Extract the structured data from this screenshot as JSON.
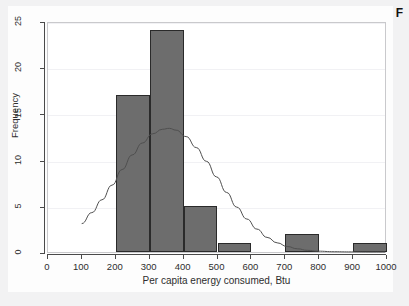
{
  "figure": {
    "corner_label": "F",
    "background_color": "#f2f2f3",
    "canvas_color": "#ffffff"
  },
  "chart_data": {
    "type": "bar",
    "title": "",
    "subtitle": "",
    "xlabel": "Per capita energy consumed, Btu",
    "ylabel": "Frequency",
    "xlim": [
      0,
      1000
    ],
    "ylim": [
      0,
      25
    ],
    "xticks": [
      0,
      100,
      200,
      300,
      400,
      500,
      600,
      700,
      800,
      900,
      1000
    ],
    "xtick_labels": [
      "0",
      "100",
      "200",
      "300",
      "400",
      "500",
      "600",
      "700",
      "800",
      "900",
      "1000"
    ],
    "yticks": [
      0,
      5,
      10,
      15,
      20,
      25
    ],
    "ytick_labels": [
      "0",
      "5",
      "10",
      "15",
      "20",
      "25"
    ],
    "grid": true,
    "grid_axis": "y",
    "legend": null,
    "bin_width": 100,
    "bar_color": "#6d6d6d",
    "bar_edge_color": "#2a2a2a",
    "categories": [
      "0-100",
      "100-200",
      "200-300",
      "300-400",
      "400-500",
      "500-600",
      "600-700",
      "700-800",
      "800-900",
      "900-1000"
    ],
    "bins": [
      {
        "x0": 0,
        "x1": 100,
        "frequency": 0
      },
      {
        "x0": 100,
        "x1": 200,
        "frequency": 0
      },
      {
        "x0": 200,
        "x1": 300,
        "frequency": 17
      },
      {
        "x0": 300,
        "x1": 400,
        "frequency": 24
      },
      {
        "x0": 400,
        "x1": 500,
        "frequency": 5
      },
      {
        "x0": 500,
        "x1": 600,
        "frequency": 1
      },
      {
        "x0": 600,
        "x1": 700,
        "frequency": 0
      },
      {
        "x0": 700,
        "x1": 800,
        "frequency": 2
      },
      {
        "x0": 800,
        "x1": 900,
        "frequency": 0
      },
      {
        "x0": 900,
        "x1": 1000,
        "frequency": 1
      }
    ],
    "values": [
      0,
      0,
      17,
      24,
      5,
      1,
      0,
      2,
      0,
      1
    ],
    "overlay": {
      "name": "normal-density-curve",
      "type": "line",
      "color": "#4f4f4f",
      "peak_x": 360,
      "peak_y": 13.5,
      "points": [
        {
          "x": 100,
          "y": 3.1
        },
        {
          "x": 130,
          "y": 4.3
        },
        {
          "x": 160,
          "y": 5.7
        },
        {
          "x": 190,
          "y": 7.3
        },
        {
          "x": 220,
          "y": 9.0
        },
        {
          "x": 250,
          "y": 10.6
        },
        {
          "x": 280,
          "y": 11.9
        },
        {
          "x": 310,
          "y": 12.9
        },
        {
          "x": 340,
          "y": 13.4
        },
        {
          "x": 360,
          "y": 13.5
        },
        {
          "x": 380,
          "y": 13.3
        },
        {
          "x": 410,
          "y": 12.6
        },
        {
          "x": 440,
          "y": 11.4
        },
        {
          "x": 470,
          "y": 9.9
        },
        {
          "x": 500,
          "y": 8.2
        },
        {
          "x": 530,
          "y": 6.5
        },
        {
          "x": 560,
          "y": 4.9
        },
        {
          "x": 590,
          "y": 3.6
        },
        {
          "x": 620,
          "y": 2.5
        },
        {
          "x": 650,
          "y": 1.6
        },
        {
          "x": 680,
          "y": 1.0
        },
        {
          "x": 710,
          "y": 0.6
        },
        {
          "x": 740,
          "y": 0.35
        },
        {
          "x": 770,
          "y": 0.18
        },
        {
          "x": 800,
          "y": 0.09
        },
        {
          "x": 850,
          "y": 0.03
        },
        {
          "x": 900,
          "y": 0.01
        },
        {
          "x": 950,
          "y": 0.0
        },
        {
          "x": 1000,
          "y": 0.0
        }
      ]
    }
  }
}
